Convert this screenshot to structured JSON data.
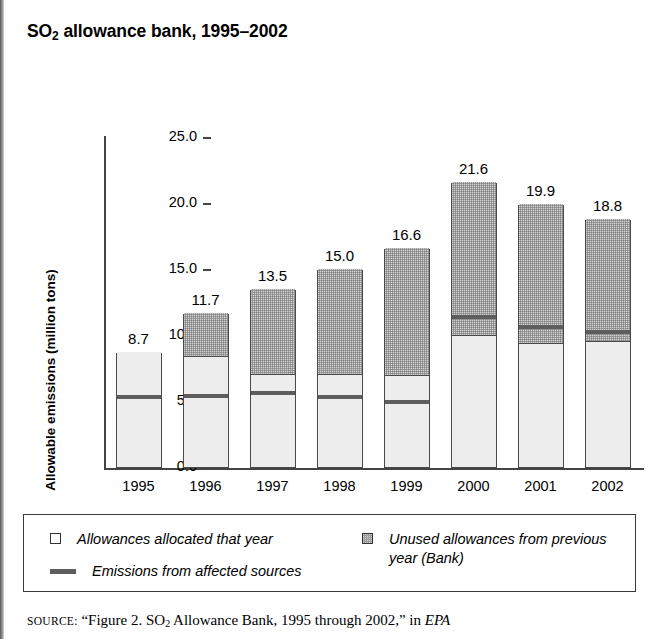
{
  "title": {
    "prefix": "SO",
    "subscript": "2",
    "suffix": " allowance bank, 1995–2002"
  },
  "axes": {
    "y_title": "Allowable emissions (million tons)",
    "y_ticks": [
      "25.0",
      "20.0",
      "15.0",
      "10.0",
      "5.0",
      "0.0"
    ]
  },
  "legend": {
    "allocated": "Allowances allocated that year",
    "bank": "Unused allowances from previous year (Bank)",
    "emissions": "Emissions from affected sources"
  },
  "source": {
    "label": "SOURCE:",
    "text_before": "“Figure 2. SO",
    "text_sub": "2",
    "text_after": " Allowance Bank, 1995 through 2002,” in ",
    "italic": "EPA"
  },
  "chart_data": {
    "type": "bar",
    "subtype": "stacked-bar-with-marker",
    "title": "SO2 allowance bank, 1995–2002",
    "xlabel": "",
    "ylabel": "Allowable emissions (million tons)",
    "ylim": [
      0,
      25
    ],
    "ytick_step": 5,
    "grid": false,
    "legend_position": "below-plot",
    "categories": [
      "1995",
      "1996",
      "1997",
      "1998",
      "1999",
      "2000",
      "2001",
      "2002"
    ],
    "totals": [
      8.7,
      11.7,
      13.5,
      15.0,
      16.6,
      21.6,
      19.9,
      18.8
    ],
    "data_labels": [
      "8.7",
      "11.7",
      "13.5",
      "15.0",
      "16.6",
      "21.6",
      "19.9",
      "18.8"
    ],
    "series": [
      {
        "name": "Allowances allocated that year",
        "color": "#ededed",
        "values": [
          8.7,
          8.3,
          7.0,
          7.0,
          6.9,
          9.9,
          9.3,
          9.5
        ]
      },
      {
        "name": "Unused allowances from previous year (Bank)",
        "color": "#9d9d9d",
        "values": [
          0.0,
          3.4,
          6.5,
          8.0,
          9.7,
          11.7,
          10.6,
          9.3
        ]
      },
      {
        "name": "Emissions from affected sources",
        "color": "#5d5d5d",
        "marker": "horizontal-line",
        "values": [
          5.3,
          5.4,
          5.6,
          5.3,
          4.9,
          11.4,
          10.6,
          10.2
        ]
      }
    ]
  }
}
